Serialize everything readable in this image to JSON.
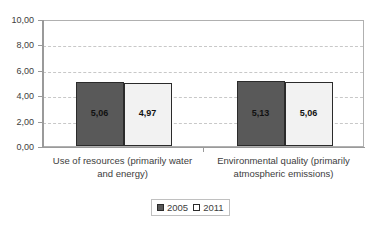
{
  "chart_data": {
    "type": "bar",
    "title": "",
    "xlabel": "",
    "ylabel": "",
    "ylim": [
      0,
      10
    ],
    "ytick_labels": [
      "10,00",
      "8,00",
      "6,00",
      "4,00",
      "2,00",
      "0,00"
    ],
    "ytick_values": [
      10,
      8,
      6,
      4,
      2,
      0
    ],
    "grid": true,
    "legend_position": "bottom-center",
    "categories": [
      "Use of resources (primarily water and energy)",
      "Environmental quality (primarily atmospheric emissions)"
    ],
    "category_lines": [
      [
        "Use of resources (primarily water",
        "and energy)"
      ],
      [
        "Environmental quality (primarily",
        "atmospheric emissions)"
      ]
    ],
    "series": [
      {
        "name": "2005",
        "color": "#595959",
        "values": [
          5.06,
          5.13
        ],
        "labels": [
          "5,06",
          "5,13"
        ]
      },
      {
        "name": "2011",
        "color": "#f2f2f2",
        "values": [
          4.97,
          5.06
        ],
        "labels": [
          "4,97",
          "5,06"
        ]
      }
    ]
  },
  "legend": {
    "items": [
      {
        "label": "2005"
      },
      {
        "label": "2011"
      }
    ]
  },
  "colors": {
    "series_2005": "#595959",
    "series_2011": "#f2f2f2",
    "grid": "#c8c8c8",
    "axis": "#9a9a9a",
    "text": "#3d3d3d"
  }
}
